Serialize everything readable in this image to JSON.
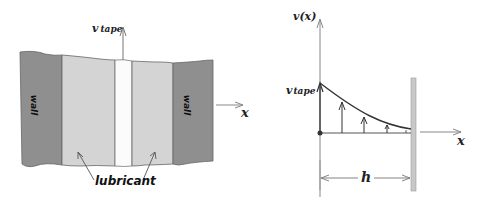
{
  "left_panel": {
    "wall_left_label": "wall",
    "wall_right_label": "wall",
    "lubricant_label": "lubricant",
    "tape_velocity_label": {
      "main": "v",
      "sub": "tape"
    },
    "x_axis_label": "x",
    "colors": {
      "wall": "#8f8f8f",
      "lubricant": "#d4d4d4",
      "tape": "#fbfbfb",
      "outline": "#555555"
    }
  },
  "right_panel": {
    "y_axis_label": "v(x)",
    "tape_velocity_label": {
      "main": "v",
      "sub": "tape"
    },
    "x_axis_label": "x",
    "gap_label": "h",
    "colors": {
      "curve": "#333333",
      "wall": "#c8c8c8",
      "axis": "#777777"
    }
  }
}
